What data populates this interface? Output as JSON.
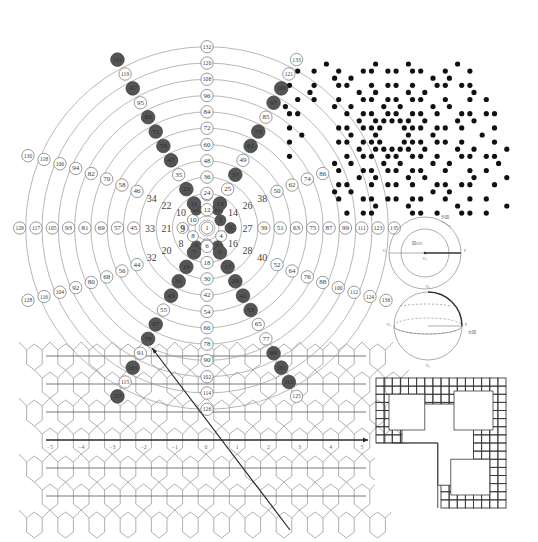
{
  "number_spiral": {
    "center": [
      207,
      228
    ],
    "ring_spacing": 16.3,
    "ring_count": 11,
    "center_label": "1",
    "inner_ring_labels": [
      {
        "text": "2",
        "angle": -30,
        "r": 0.95,
        "prime": true
      },
      {
        "text": "3",
        "angle": 0,
        "r": 1.45,
        "prime": true
      },
      {
        "text": "4",
        "angle": 30,
        "r": 1.0,
        "prime": false
      },
      {
        "text": "5",
        "angle": 60,
        "r": 1.3,
        "prime": true
      },
      {
        "text": "6",
        "angle": 90,
        "r": 1.0,
        "prime": false
      },
      {
        "text": "7",
        "angle": 120,
        "r": 1.3,
        "prime": true
      },
      {
        "text": "8",
        "angle": 150,
        "r": 1.0,
        "prime": false
      },
      {
        "text": "9",
        "angle": 180,
        "r": 1.5,
        "prime": false
      },
      {
        "text": "10",
        "angle": 210,
        "r": 1.0,
        "prime": false
      },
      {
        "text": "11",
        "angle": 240,
        "r": 1.3,
        "prime": true
      },
      {
        "text": "12",
        "angle": 270,
        "r": 2.0,
        "prime": false
      },
      {
        "text": "13",
        "angle": 300,
        "r": 1.3,
        "prime": true
      }
    ],
    "spokes": {
      "up": [
        "12",
        "24",
        "36",
        "48",
        "60",
        "72",
        "84",
        "96",
        "108",
        "120",
        "132"
      ],
      "down": [
        "6",
        "18",
        "30",
        "42",
        "54",
        "66",
        "78",
        "90",
        "102",
        "114",
        "126"
      ],
      "left": [
        "9",
        "21",
        "33",
        "45",
        "57",
        "69",
        "81",
        "93",
        "105",
        "117",
        "129"
      ],
      "right": [
        "15",
        "27",
        "39",
        "51",
        "63",
        "75",
        "87",
        "99",
        "111",
        "123",
        "135"
      ],
      "upper_left_diag": [
        "10",
        "22",
        "34",
        "46",
        "58",
        "70",
        "82",
        "94",
        "106",
        "118",
        "130"
      ],
      "upper_right_diag": [
        "14",
        "26",
        "38",
        "50",
        "62",
        "74",
        "86"
      ],
      "lower_left_diag": [
        "8",
        "20",
        "32",
        "44",
        "56",
        "68",
        "80",
        "92",
        "104",
        "116",
        "128"
      ],
      "lower_right_diag": [
        "16",
        "28",
        "40",
        "52",
        "64",
        "76",
        "88",
        "100",
        "112",
        "124",
        "136"
      ]
    },
    "prime_arms": {
      "upper_left": [
        {
          "text": "11",
          "prime": true
        },
        {
          "text": "23",
          "prime": true
        },
        {
          "text": "35",
          "prime": false
        },
        {
          "text": "47",
          "prime": true
        },
        {
          "text": "59",
          "prime": true
        },
        {
          "text": "71",
          "prime": true
        },
        {
          "text": "83",
          "prime": true
        },
        {
          "text": "95",
          "prime": false
        },
        {
          "text": "107",
          "prime": true
        },
        {
          "text": "119",
          "prime": false
        },
        {
          "text": "131",
          "prime": true
        }
      ],
      "upper_right": [
        {
          "text": "13",
          "prime": true
        },
        {
          "text": "25",
          "prime": false
        },
        {
          "text": "37",
          "prime": true
        },
        {
          "text": "49",
          "prime": false
        },
        {
          "text": "61",
          "prime": true
        },
        {
          "text": "73",
          "prime": true
        },
        {
          "text": "85",
          "prime": false
        },
        {
          "text": "97",
          "prime": true
        },
        {
          "text": "109",
          "prime": true
        },
        {
          "text": "121",
          "prime": false
        },
        {
          "text": "133",
          "prime": false
        }
      ],
      "lower_left": [
        {
          "text": "7",
          "prime": true
        },
        {
          "text": "19",
          "prime": true
        },
        {
          "text": "31",
          "prime": true
        },
        {
          "text": "43",
          "prime": true
        },
        {
          "text": "55",
          "prime": false
        },
        {
          "text": "67",
          "prime": true
        },
        {
          "text": "79",
          "prime": true
        },
        {
          "text": "91",
          "prime": false
        },
        {
          "text": "103",
          "prime": true
        },
        {
          "text": "115",
          "prime": false
        },
        {
          "text": "127",
          "prime": true
        }
      ],
      "lower_right": [
        {
          "text": "5",
          "prime": true
        },
        {
          "text": "17",
          "prime": true
        },
        {
          "text": "29",
          "prime": true
        },
        {
          "text": "41",
          "prime": true
        },
        {
          "text": "53",
          "prime": true
        },
        {
          "text": "65",
          "prime": false
        },
        {
          "text": "77",
          "prime": false
        },
        {
          "text": "89",
          "prime": true
        },
        {
          "text": "101",
          "prime": true
        },
        {
          "text": "113",
          "prime": true
        },
        {
          "text": "125",
          "prime": false
        }
      ]
    }
  },
  "prime_dot_pattern": {
    "center": [
      392,
      135
    ],
    "spacing": 8.2,
    "radius_limit": 9,
    "dot_radius": 2.6
  },
  "circle_diagram": {
    "center": [
      425,
      253
    ],
    "outer_r": 36,
    "inner_r": 24,
    "labels": {
      "outer": "外圆",
      "center": "圆心O",
      "left_pt": "O₁",
      "right_pt": "P",
      "bottom": "O₂"
    }
  },
  "sphere_diagram": {
    "center": [
      428,
      326
    ],
    "r": 34,
    "labels": {
      "top": "O₁",
      "bottom": "O₂",
      "left": "O₃",
      "right": "P",
      "arc": "大圆"
    }
  },
  "lattice": {
    "x0": 50,
    "x1": 362,
    "axis_y": 440,
    "row_spacing": 28,
    "rows": 6,
    "first_row_y": 356,
    "axis_labels": [
      "−5",
      "−4",
      "−3",
      "−2",
      "−1",
      "0",
      "1",
      "2",
      "3",
      "4",
      "5"
    ],
    "arrow": {
      "from": [
        290,
        530
      ],
      "to": [
        152,
        348
      ]
    }
  },
  "fractal": {
    "box": [
      376,
      378,
      130,
      128
    ]
  }
}
